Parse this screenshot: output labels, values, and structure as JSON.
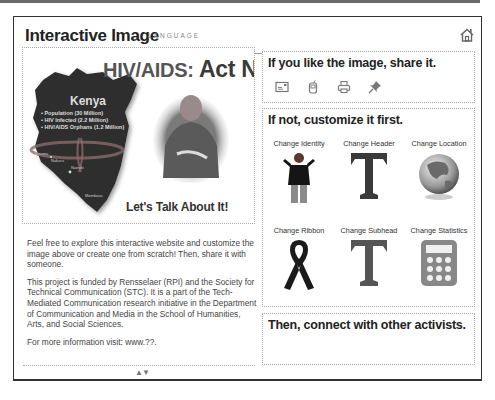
{
  "header": {
    "title": "Interactive Image",
    "language_label": "LANGUAGE",
    "home_icon": "home-icon"
  },
  "poster": {
    "title_prefix": "HIV/AIDS:",
    "title_main": "Act Now",
    "country": "Kenya",
    "stats": [
      "• Population (30 Million)",
      "• HIV Infected (2.2 Million)",
      "• HIV/AIDS Orphans (1.2 Million)"
    ],
    "cities": [
      "Kisumu",
      "Nakuru",
      "Nairobi",
      "Mombasa"
    ],
    "tagline": "Let's Talk About It!"
  },
  "description": {
    "paragraphs": [
      "Feel free to explore this interactive website and customize the image above or create one from scratch! Then, share it with someone.",
      "This project is funded by Rensselaer (RPI) and the Society for Technical Communication (STC). It is a part of the Tech-Mediated Communication research initiative in the Department of Communication and Media in the School of Humanities, Arts, and Social Sciences.",
      "For more information visit: www.??."
    ],
    "scroll_arrows": "▲▼"
  },
  "share": {
    "title": "If you like the image, share it.",
    "icons": [
      "email-icon",
      "mobile-phone-icon",
      "printer-icon",
      "pushpin-icon"
    ]
  },
  "customize": {
    "title": "If not, customize it first.",
    "options": [
      {
        "label": "Change Identity",
        "icon": "person-icon"
      },
      {
        "label": "Change Header",
        "icon": "letter-t-icon"
      },
      {
        "label": "Change Location",
        "icon": "globe-icon"
      },
      {
        "label": "Change Ribbon",
        "icon": "awareness-ribbon-icon"
      },
      {
        "label": "Change Subhead",
        "icon": "letter-t-icon"
      },
      {
        "label": "Change Statistics",
        "icon": "calculator-icon"
      }
    ]
  },
  "connect": {
    "title": "Then, connect with other activists."
  },
  "colors": {
    "frame_border": "#333333",
    "panel_border": "#aaaaaa",
    "map_fill": "#2e2e2e",
    "icon_gray": "#777777"
  }
}
